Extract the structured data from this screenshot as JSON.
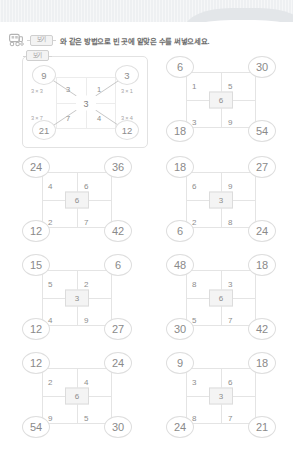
{
  "header": {
    "icon": "train-icon",
    "example_chip_label": "보기",
    "instruction_text": "와 같은 방법으로 빈 곳에 알맞은 수를 써넣으세요."
  },
  "example": {
    "tag_label": "보기",
    "center": "3",
    "corners": {
      "top_left": "9",
      "top_right": "3",
      "bottom_left": "21",
      "bottom_right": "12"
    },
    "inner": {
      "top_left": "3",
      "top_right": "1",
      "bottom_left": "7",
      "bottom_right": "4"
    },
    "mult_labels": {
      "top_left": "3 × 3",
      "top_right": "3 × 1",
      "bottom_left": "3 × 7",
      "bottom_right": "3 × 4"
    }
  },
  "puzzles": [
    {
      "id": "puzzle-1",
      "center": "6",
      "corners": {
        "top_left": "6",
        "top_right": "30",
        "bottom_left": "18",
        "bottom_right": "54"
      },
      "inner": {
        "top_left": "1",
        "top_right": "5",
        "bottom_left": "3",
        "bottom_right": "9"
      }
    },
    {
      "id": "puzzle-2",
      "center": "6",
      "corners": {
        "top_left": "24",
        "top_right": "36",
        "bottom_left": "12",
        "bottom_right": "42"
      },
      "inner": {
        "top_left": "4",
        "top_right": "6",
        "bottom_left": "2",
        "bottom_right": "7"
      }
    },
    {
      "id": "puzzle-3",
      "center": "3",
      "corners": {
        "top_left": "18",
        "top_right": "27",
        "bottom_left": "6",
        "bottom_right": "24"
      },
      "inner": {
        "top_left": "6",
        "top_right": "9",
        "bottom_left": "2",
        "bottom_right": "8"
      }
    },
    {
      "id": "puzzle-4",
      "center": "3",
      "corners": {
        "top_left": "15",
        "top_right": "6",
        "bottom_left": "12",
        "bottom_right": "27"
      },
      "inner": {
        "top_left": "5",
        "top_right": "2",
        "bottom_left": "4",
        "bottom_right": "9"
      }
    },
    {
      "id": "puzzle-5",
      "center": "6",
      "corners": {
        "top_left": "48",
        "top_right": "18",
        "bottom_left": "30",
        "bottom_right": "42"
      },
      "inner": {
        "top_left": "8",
        "top_right": "3",
        "bottom_left": "5",
        "bottom_right": "7"
      }
    },
    {
      "id": "puzzle-6",
      "center": "6",
      "corners": {
        "top_left": "12",
        "top_right": "24",
        "bottom_left": "54",
        "bottom_right": "30"
      },
      "inner": {
        "top_left": "2",
        "top_right": "4",
        "bottom_left": "9",
        "bottom_right": "5"
      }
    },
    {
      "id": "puzzle-7",
      "center": "3",
      "corners": {
        "top_left": "9",
        "top_right": "18",
        "bottom_left": "24",
        "bottom_right": "21"
      },
      "inner": {
        "top_left": "3",
        "top_right": "6",
        "bottom_left": "8",
        "bottom_right": "7"
      }
    }
  ],
  "colors": {
    "text": "#8a8a8a",
    "line": "#e4e4e4",
    "banner": "#eef0f2",
    "center_fill": "#f4f4f4"
  }
}
